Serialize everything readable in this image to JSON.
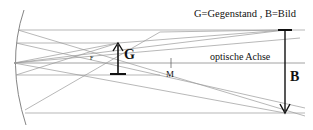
{
  "diagram": {
    "legend": "G=Gegenstand , B=Bild",
    "axis_label": "optische Achse",
    "focus_label": "F",
    "center_label": "M",
    "object_label": "G",
    "image_label": "B",
    "colors": {
      "ray": "#9a9a9a",
      "mirror": "#777777",
      "arrow": "#111111",
      "text": "#111111"
    }
  }
}
